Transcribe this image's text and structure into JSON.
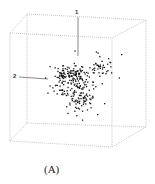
{
  "caption": "(A)",
  "chart_data": {
    "type": "scatter",
    "subtype": "3d-scatter",
    "title": "",
    "axes": [
      {
        "label": "1",
        "position": "vertical"
      },
      {
        "label": "2",
        "position": "horizontal-left"
      }
    ],
    "box": "dotted-cube",
    "grid": false,
    "legend": null,
    "n_points_approx": 300,
    "cluster_description": "dense point cloud centered near axis origin, elongated down-right, with a few sparse outliers to the right",
    "colors": {
      "points": "#1a1a1a",
      "box": "#9a9a9a",
      "axes": "#555555"
    }
  }
}
